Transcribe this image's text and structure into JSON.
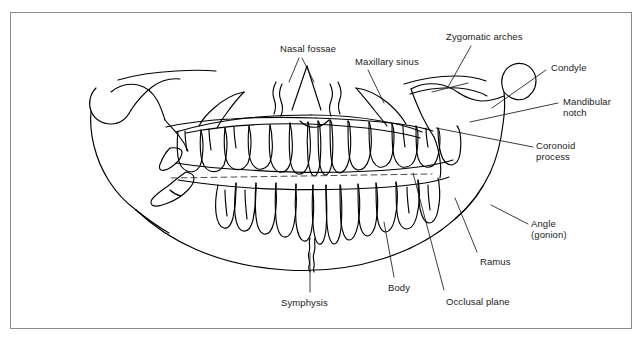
{
  "figure": {
    "frame": {
      "border_color": "#8c8c8c",
      "background_color": "#ffffff"
    },
    "line_color": "#000000",
    "dashed_line_color": "#4d4d4d",
    "text_color": "#1a1a1a"
  },
  "labels": [
    {
      "id": "nasal-fossae",
      "text": "Nasal fossae",
      "x": 280,
      "y": 43,
      "align": "left"
    },
    {
      "id": "maxillary-sinus",
      "text": "Maxillary sinus",
      "x": 355,
      "y": 56,
      "align": "left"
    },
    {
      "id": "zygomatic-arches",
      "text": "Zygomatic arches",
      "x": 446,
      "y": 31,
      "align": "left"
    },
    {
      "id": "condyle",
      "text": "Condyle",
      "x": 551,
      "y": 62,
      "align": "left"
    },
    {
      "id": "mandibular-notch",
      "text": "Mandibular\nnotch",
      "x": 563,
      "y": 96,
      "align": "left"
    },
    {
      "id": "coronoid-process",
      "text": "Coronoid\nprocess",
      "x": 536,
      "y": 140,
      "align": "left"
    },
    {
      "id": "angle-gonion",
      "text": "Angle\n(gonion)",
      "x": 531,
      "y": 218,
      "align": "left"
    },
    {
      "id": "ramus",
      "text": "Ramus",
      "x": 480,
      "y": 256,
      "align": "left"
    },
    {
      "id": "occlusal-plane",
      "text": "Occlusal plane",
      "x": 446,
      "y": 296,
      "align": "left"
    },
    {
      "id": "body",
      "text": "Body",
      "x": 388,
      "y": 282,
      "align": "left"
    },
    {
      "id": "symphysis",
      "text": "Symphysis",
      "x": 281,
      "y": 297,
      "align": "left"
    }
  ],
  "leader_lines": [
    {
      "id": "leader-nasal-fossae-left",
      "x1": 299,
      "y1": 58,
      "x2": 289,
      "y2": 82
    },
    {
      "id": "leader-nasal-fossae-right",
      "x1": 302,
      "y1": 58,
      "x2": 314,
      "y2": 82
    },
    {
      "id": "leader-maxillary-sinus",
      "x1": 368,
      "y1": 70,
      "x2": 384,
      "y2": 103
    },
    {
      "id": "leader-zygomatic-arches",
      "x1": 471,
      "y1": 46,
      "x2": 448,
      "y2": 87
    },
    {
      "id": "leader-zygomatic-tick",
      "x1": 432,
      "y1": 92,
      "x2": 468,
      "y2": 83
    },
    {
      "id": "leader-condyle",
      "x1": 546,
      "y1": 70,
      "x2": 492,
      "y2": 108
    },
    {
      "id": "leader-mandibular-notch",
      "x1": 558,
      "y1": 103,
      "x2": 470,
      "y2": 122
    },
    {
      "id": "leader-coronoid-process",
      "x1": 533,
      "y1": 147,
      "x2": 436,
      "y2": 128
    },
    {
      "id": "leader-angle-gonion",
      "x1": 528,
      "y1": 224,
      "x2": 491,
      "y2": 205
    },
    {
      "id": "leader-ramus",
      "x1": 477,
      "y1": 252,
      "x2": 455,
      "y2": 198
    },
    {
      "id": "leader-occlusal-plane",
      "x1": 444,
      "y1": 290,
      "x2": 413,
      "y2": 173
    },
    {
      "id": "leader-body",
      "x1": 394,
      "y1": 277,
      "x2": 384,
      "y2": 222
    },
    {
      "id": "leader-symphysis",
      "x1": 310,
      "y1": 292,
      "x2": 310,
      "y2": 253
    }
  ],
  "occlusal_plane": {
    "id": "occlusal-plane-dashed",
    "x1": 171,
    "y1": 178,
    "x2": 432,
    "y2": 174,
    "style": "dashed"
  }
}
